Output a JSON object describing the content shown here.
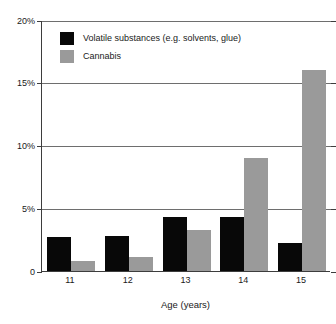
{
  "chart_data": {
    "type": "bar",
    "title": "",
    "xlabel": "Age (years)",
    "ylabel": "",
    "categories": [
      "11",
      "12",
      "13",
      "14",
      "15"
    ],
    "series": [
      {
        "name": "Volatile substances (e.g. solvents, glue)",
        "color": "#080808",
        "values": [
          2.7,
          2.8,
          4.3,
          4.3,
          2.2
        ]
      },
      {
        "name": "Cannabis",
        "color": "#9a9a9a",
        "values": [
          0.8,
          1.1,
          3.3,
          9.0,
          16.0
        ]
      }
    ],
    "ylim": [
      0,
      20
    ],
    "yticks": [
      0,
      5,
      10,
      15,
      20
    ],
    "ytick_labels": [
      "0",
      "5%",
      "10%",
      "15%",
      "20%"
    ],
    "grid": true,
    "legend_position": "top-left"
  },
  "legend": {
    "items": [
      {
        "label": "Volatile substances (e.g. solvents, glue)"
      },
      {
        "label": "Cannabis"
      }
    ]
  },
  "axes": {
    "x_title": "Age (years)"
  }
}
